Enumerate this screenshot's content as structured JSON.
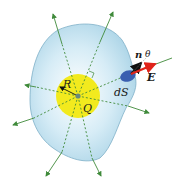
{
  "diagram": {
    "labels": {
      "radius": "R",
      "charge": "Q",
      "surface_element": "dS",
      "normal": "n",
      "angle": "θ",
      "field": "E"
    },
    "colors": {
      "surface_fill": "#c6e3f0",
      "surface_stroke": "#7fb0c8",
      "sphere_fill": "#f2ea1e",
      "field_lines": "#3f8a3a",
      "charge_dot": "#6a8a7a",
      "patch": "#3a5fb0",
      "normal_arrow": "#111111",
      "E_arrow": "#e0231a"
    }
  }
}
